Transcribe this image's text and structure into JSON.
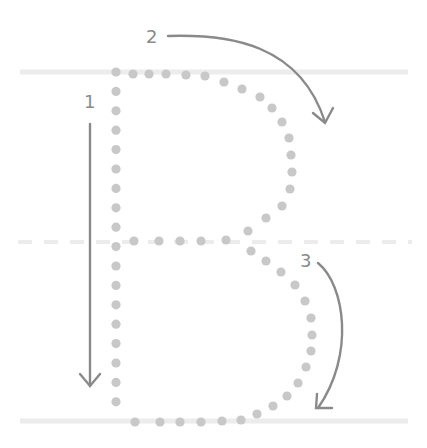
{
  "worksheet": {
    "letter": "B",
    "title": "Letter B stroke tracing guide",
    "colors": {
      "background": "#ffffff",
      "guide_line": "#ececec",
      "dots": "#c8c8c8",
      "arrows": "#8a8a8a",
      "numbers": "#8a8a8a"
    },
    "guide_lines": {
      "top_y": 72,
      "middle_y": 242,
      "bottom_y": 421,
      "x_start": 20,
      "x_end": 408
    },
    "strokes": [
      {
        "step": "1",
        "label": "1",
        "description": "Straight line down",
        "label_x": 90,
        "label_y": 108
      },
      {
        "step": "2",
        "label": "2",
        "description": "Curve from top around to middle",
        "label_x": 152,
        "label_y": 42
      },
      {
        "step": "3",
        "label": "3",
        "description": "Curve from middle around to bottom",
        "label_x": 307,
        "label_y": 267
      }
    ]
  }
}
